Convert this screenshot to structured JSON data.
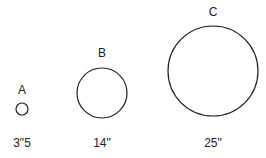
{
  "items": [
    {
      "letter": "A",
      "size": "3\"5",
      "cx": 22,
      "cy": 109,
      "r": 6,
      "letter_y": 83
    },
    {
      "letter": "B",
      "size": "14\"",
      "cx": 102,
      "cy": 93,
      "r": 25,
      "letter_y": 46
    },
    {
      "letter": "C",
      "size": "25\"",
      "cx": 213,
      "cy": 71,
      "r": 45,
      "letter_y": 5
    }
  ],
  "size_label_y": 136,
  "stroke_color": "#222222"
}
